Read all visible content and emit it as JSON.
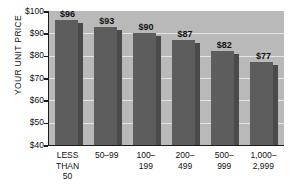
{
  "chart_data": {
    "type": "bar",
    "title": "",
    "subtitle": "",
    "xlabel": "",
    "ylabel": "YOUR UNIT PRICE",
    "ylim": [
      40,
      100
    ],
    "ytick_labels": [
      "$100",
      "$90",
      "$80",
      "$70",
      "$60",
      "$50",
      "$40"
    ],
    "ytick_values": [
      100,
      90,
      80,
      70,
      60,
      50,
      40
    ],
    "grid": true,
    "legend": false,
    "categories": [
      "LESS\nTHAN\n50",
      "50–99",
      "100–\n199",
      "200–\n499",
      "500–\n999",
      "1,000–\n2,999"
    ],
    "values": [
      96,
      93,
      90,
      87,
      82,
      77
    ],
    "value_labels": [
      "$96",
      "$93",
      "$90",
      "$87",
      "$82",
      "$77"
    ],
    "colors": {
      "page_background": "#ffffff",
      "plot_background": "#b9b9b9",
      "bar_face": "#5d5d5d",
      "bar_side": "#4a4a4a",
      "gridline": "#e4e4e4",
      "axis": "#1b1b1b",
      "text": "#111111"
    }
  }
}
